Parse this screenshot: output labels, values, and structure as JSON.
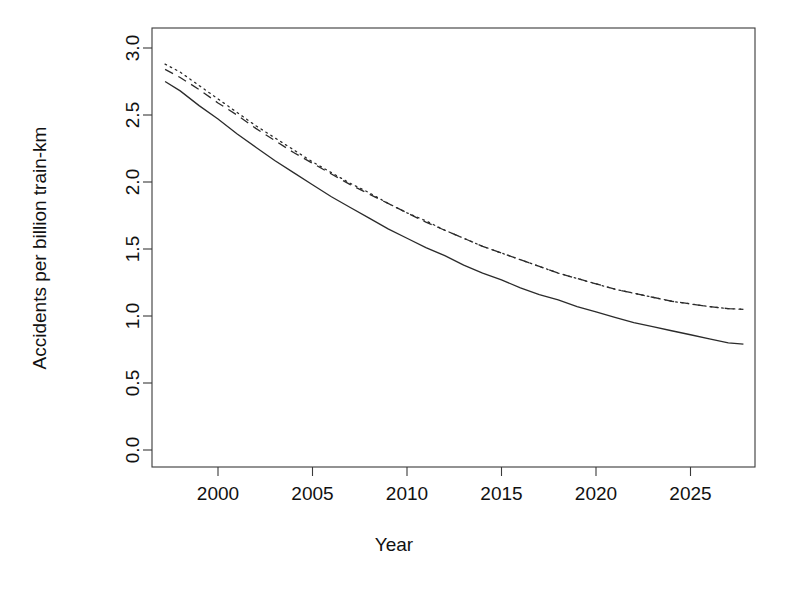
{
  "chart_data": {
    "type": "line",
    "title": "",
    "xlabel": "Year",
    "ylabel": "Accidents per billion train-km",
    "xlim": [
      1996.6,
      1996.6
    ],
    "ylim": [
      0.0,
      3.1
    ],
    "grid": false,
    "legend": "none",
    "xticks": [
      2000,
      2005,
      2010,
      2015,
      2020,
      2025
    ],
    "xtick_labels": [
      "2000",
      "2005",
      "2010",
      "2015",
      "2020",
      "2025"
    ],
    "yticks": [
      0.0,
      0.5,
      1.0,
      1.5,
      2.0,
      2.5,
      3.0
    ],
    "ytick_labels": [
      "0.0",
      "0.5",
      "1.0",
      "1.5",
      "2.0",
      "2.5",
      "3.0"
    ],
    "x": [
      1997.2,
      1998,
      1999,
      2000,
      2001,
      2002,
      2003,
      2004,
      2005,
      2006,
      2007,
      2008,
      2009,
      2010,
      2011,
      2012,
      2013,
      2014,
      2015,
      2016,
      2017,
      2018,
      2019,
      2020,
      2021,
      2022,
      2023,
      2024,
      2025,
      2026,
      2027,
      2027.8
    ],
    "series": [
      {
        "name": "dotted-upper",
        "style": "dotted",
        "values": [
          2.88,
          2.82,
          2.72,
          2.62,
          2.52,
          2.42,
          2.33,
          2.24,
          2.15,
          2.07,
          1.99,
          1.92,
          1.84,
          1.77,
          1.71,
          1.64,
          1.58,
          1.52,
          1.47,
          1.42,
          1.37,
          1.32,
          1.28,
          1.24,
          1.2,
          1.17,
          1.14,
          1.11,
          1.09,
          1.07,
          1.055,
          1.05
        ]
      },
      {
        "name": "dashed-middle",
        "style": "dashed",
        "values": [
          2.84,
          2.78,
          2.69,
          2.59,
          2.5,
          2.4,
          2.31,
          2.22,
          2.14,
          2.06,
          1.98,
          1.91,
          1.84,
          1.77,
          1.7,
          1.64,
          1.58,
          1.52,
          1.47,
          1.42,
          1.37,
          1.32,
          1.28,
          1.24,
          1.2,
          1.17,
          1.14,
          1.11,
          1.09,
          1.07,
          1.055,
          1.05
        ]
      },
      {
        "name": "solid-lower",
        "style": "solid",
        "values": [
          2.75,
          2.68,
          2.57,
          2.47,
          2.36,
          2.26,
          2.16,
          2.07,
          1.98,
          1.89,
          1.81,
          1.73,
          1.65,
          1.58,
          1.51,
          1.45,
          1.38,
          1.32,
          1.27,
          1.21,
          1.16,
          1.12,
          1.07,
          1.03,
          0.99,
          0.95,
          0.92,
          0.89,
          0.86,
          0.83,
          0.8,
          0.79
        ]
      }
    ]
  },
  "colors": {
    "line": "#2b2b2b",
    "axis": "#3a3a3a",
    "background": "#ffffff"
  }
}
